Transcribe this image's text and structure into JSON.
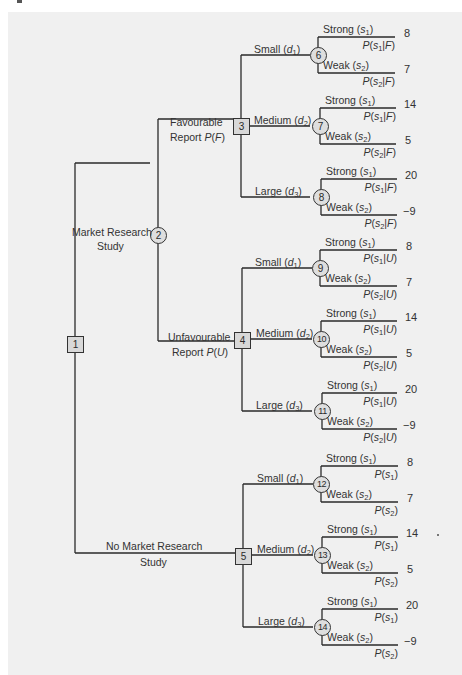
{
  "figure": {
    "type": "decision-tree",
    "background": "#f0f0f0",
    "line_color": "#2a2a2a",
    "node_fill": "#d8d8d8"
  },
  "nodes": {
    "n1": "1",
    "n2": "2",
    "n3": "3",
    "n4": "4",
    "n5": "5",
    "n6": "6",
    "n7": "7",
    "n8": "8",
    "n9": "9",
    "n10": "10",
    "n11": "11",
    "n12": "12",
    "n13": "13",
    "n14": "14"
  },
  "branches": {
    "market_research": {
      "line1": "Market Research",
      "line2": "Study"
    },
    "no_market_research": {
      "line1": "No Market Research",
      "line2": "Study"
    },
    "favourable": {
      "line1": "Favourable",
      "line2_prefix": "Report ",
      "prob": "P(F)"
    },
    "unfavourable": {
      "line1": "Unfavourable",
      "line2_prefix": "Report ",
      "prob": "P(U)"
    }
  },
  "decisions": {
    "small": {
      "label": "Small",
      "var": "d",
      "sub": "1"
    },
    "medium": {
      "label": "Medium",
      "var": "d",
      "sub": "2"
    },
    "large": {
      "label": "Large",
      "var": "d",
      "sub": "3"
    }
  },
  "states": {
    "strong": {
      "label": "Strong",
      "var": "s",
      "sub": "1"
    },
    "weak": {
      "label": "Weak",
      "var": "s",
      "sub": "2"
    }
  },
  "subtrees": [
    {
      "condition": "F",
      "groups": [
        {
          "decision": "small",
          "node": "6",
          "payoffs": [
            "8",
            "7"
          ],
          "probs": [
            "P(s1|F)",
            "P(s2|F)"
          ]
        },
        {
          "decision": "medium",
          "node": "7",
          "payoffs": [
            "14",
            "5"
          ],
          "probs": [
            "P(s1|F)",
            "P(s2|F)"
          ]
        },
        {
          "decision": "large",
          "node": "8",
          "payoffs": [
            "20",
            "−9"
          ],
          "probs": [
            "P(s1|F)",
            "P(s2|F)"
          ]
        }
      ]
    },
    {
      "condition": "U",
      "groups": [
        {
          "decision": "small",
          "node": "9",
          "payoffs": [
            "8",
            "7"
          ],
          "probs": [
            "P(s1|U)",
            "P(s2|U)"
          ]
        },
        {
          "decision": "medium",
          "node": "10",
          "payoffs": [
            "14",
            "5"
          ],
          "probs": [
            "P(s1|U)",
            "P(s2|U)"
          ]
        },
        {
          "decision": "large",
          "node": "11",
          "payoffs": [
            "20",
            "−9"
          ],
          "probs": [
            "P(s1|U)",
            "P(s2|U)"
          ]
        }
      ]
    },
    {
      "condition": "",
      "groups": [
        {
          "decision": "small",
          "node": "12",
          "payoffs": [
            "8",
            "7"
          ],
          "probs": [
            "P(s1)",
            "P(s2)"
          ]
        },
        {
          "decision": "medium",
          "node": "13",
          "payoffs": [
            "14",
            "5"
          ],
          "probs": [
            "P(s1)",
            "P(s2)"
          ]
        },
        {
          "decision": "large",
          "node": "14",
          "payoffs": [
            "20",
            "−9"
          ],
          "probs": [
            "P(s1)",
            "P(s2)"
          ]
        }
      ]
    }
  ],
  "payoffs": {
    "p6a": "8",
    "p6b": "7",
    "p7a": "14",
    "p7b": "5",
    "p8a": "20",
    "p8b": "−9",
    "p9a": "8",
    "p9b": "7",
    "p10a": "14",
    "p10b": "5",
    "p11a": "20",
    "p11b": "−9",
    "p12a": "8",
    "p12b": "7",
    "p13a": "14",
    "p13b": "5",
    "p14a": "20",
    "p14b": "−9"
  },
  "prob_text": {
    "P": "P",
    "open": "(",
    "close": ")",
    "bar": "|",
    "F": "F",
    "U": "U",
    "s": "s",
    "one": "1",
    "two": "2"
  }
}
